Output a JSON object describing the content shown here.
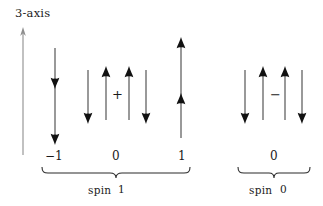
{
  "figure": {
    "axis": {
      "label": "3-axis",
      "icon": "up-arrow-icon",
      "color": "#8a8a8a"
    },
    "arrow_color": "#111111",
    "groups": [
      {
        "id": "spin-1",
        "brace_label": "spin",
        "brace_value": "1",
        "states": [
          {
            "m_label": "−1",
            "terms": [
              {
                "arrows": [
                  "down",
                  "down"
                ],
                "shared_line": true
              }
            ],
            "operator": ""
          },
          {
            "m_label": "0",
            "terms": [
              {
                "arrows": [
                  "down",
                  "up"
                ],
                "shared_line": false
              },
              {
                "arrows": [
                  "up",
                  "down"
                ],
                "shared_line": false
              }
            ],
            "operator": "+"
          },
          {
            "m_label": "1",
            "terms": [
              {
                "arrows": [
                  "up",
                  "up"
                ],
                "shared_line": true
              }
            ],
            "operator": ""
          }
        ]
      },
      {
        "id": "spin-0",
        "brace_label": "spin",
        "brace_value": "0",
        "states": [
          {
            "m_label": "0",
            "terms": [
              {
                "arrows": [
                  "down",
                  "up"
                ],
                "shared_line": false
              },
              {
                "arrows": [
                  "up",
                  "down"
                ],
                "shared_line": false
              }
            ],
            "operator": "−"
          }
        ]
      }
    ]
  }
}
